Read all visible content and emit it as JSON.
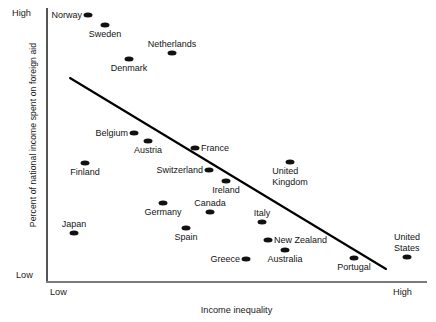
{
  "chart_data": {
    "type": "scatter",
    "title": "",
    "xlabel": "Income inequality",
    "ylabel": "Percent of national income spent on foreign aid",
    "x_ticks": [
      "Low",
      "High"
    ],
    "y_ticks": [
      "High",
      "Low"
    ],
    "xlim": [
      "Low",
      "High"
    ],
    "ylim": [
      "Low",
      "High"
    ],
    "grid": false,
    "legend": "none",
    "trendline": {
      "visible": true,
      "direction": "negative",
      "x_start": 70,
      "y_start": 78,
      "x_end": 386,
      "y_end": 269
    },
    "points": [
      {
        "label": "Norway",
        "px": 88,
        "py": 15,
        "anchor": "left"
      },
      {
        "label": "Sweden",
        "px": 105,
        "py": 25,
        "anchor": "below"
      },
      {
        "label": "Netherlands",
        "px": 172,
        "py": 53,
        "anchor": "above"
      },
      {
        "label": "Denmark",
        "px": 129,
        "py": 59,
        "anchor": "below"
      },
      {
        "label": "Belgium",
        "px": 134,
        "py": 133,
        "anchor": "left"
      },
      {
        "label": "Austria",
        "px": 148,
        "py": 141,
        "anchor": "below"
      },
      {
        "label": "France",
        "px": 195,
        "py": 148,
        "anchor": "right"
      },
      {
        "label": "Finland",
        "px": 85,
        "py": 163,
        "anchor": "below"
      },
      {
        "label": "Switzerland",
        "px": 209,
        "py": 170,
        "anchor": "left"
      },
      {
        "label": "Ireland",
        "px": 226,
        "py": 181,
        "anchor": "below"
      },
      {
        "label": "United\nKingdom",
        "px": 290,
        "py": 162,
        "anchor": "below"
      },
      {
        "label": "Germany",
        "px": 163,
        "py": 203,
        "anchor": "below"
      },
      {
        "label": "Canada",
        "px": 210,
        "py": 212,
        "anchor": "above"
      },
      {
        "label": "Japan",
        "px": 74,
        "py": 233,
        "anchor": "above"
      },
      {
        "label": "Spain",
        "px": 186,
        "py": 228,
        "anchor": "below"
      },
      {
        "label": "Italy",
        "px": 262,
        "py": 222,
        "anchor": "above"
      },
      {
        "label": "New Zealand",
        "px": 268,
        "py": 240,
        "anchor": "right"
      },
      {
        "label": "Greece",
        "px": 246,
        "py": 259,
        "anchor": "left"
      },
      {
        "label": "Australia",
        "px": 285,
        "py": 250,
        "anchor": "below"
      },
      {
        "label": "Portugal",
        "px": 354,
        "py": 258,
        "anchor": "below"
      },
      {
        "label": "United\nStates",
        "px": 407,
        "py": 257,
        "anchor": "above"
      }
    ]
  },
  "colors": {
    "point": "#111111",
    "trendline": "#000000",
    "axis": "#6f6f6f",
    "text": "#141414",
    "background": "#ffffff"
  }
}
